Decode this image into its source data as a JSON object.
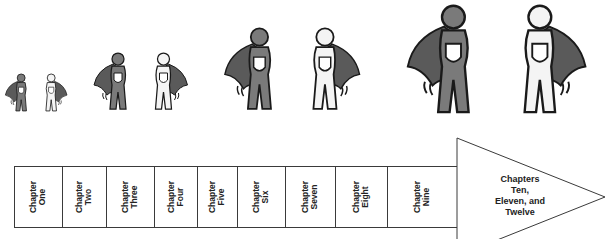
{
  "figures": [
    {
      "x": 4,
      "y": 72,
      "scale": 0.33
    },
    {
      "x": 92,
      "y": 50,
      "scale": 0.5
    },
    {
      "x": 222,
      "y": 24,
      "scale": 0.72
    },
    {
      "x": 404,
      "y": 0,
      "scale": 0.95
    }
  ],
  "colors": {
    "dark_hero": "#7a7a7a",
    "cape": "#5a5a5a",
    "light_hero": "#f4f4f4",
    "outline": "#1a1a1a",
    "line": "#3a3a3a"
  },
  "timeline": {
    "chapters": [
      {
        "label": "Chapter\nOne"
      },
      {
        "label": "Chapter\nTwo"
      },
      {
        "label": "Chapter\nThree"
      },
      {
        "label": "Chapter\nFour"
      },
      {
        "label": "Chapter\nFive"
      },
      {
        "label": "Chapter\nSix"
      },
      {
        "label": "Chapter\nSeven"
      },
      {
        "label": "Chapter\nEight"
      },
      {
        "label": "Chapter\nNine"
      }
    ],
    "arrow_label": "Chapters\nTen,\nEleven, and\nTwelve"
  }
}
